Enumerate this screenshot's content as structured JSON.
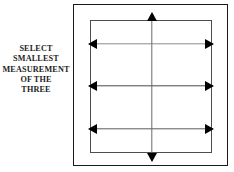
{
  "figure": {
    "background_color": "#ffffff",
    "caption": {
      "name": "instruction-text",
      "lines": [
        "SELECT",
        "SMALLEST",
        "MEASUREMENT",
        "OF THE",
        "THREE"
      ],
      "full_text": "SELECT SMALLEST MEASUREMENT OF THE THREE",
      "color": "#1d1d1d",
      "align": "center"
    },
    "outer_frame": {
      "name": "outer-frame",
      "border_color": "#1a1a1a"
    },
    "inner_box": {
      "name": "inner-measurement-box",
      "border_color": "#4d4d4d"
    },
    "arrows": [
      {
        "id": "arrow-top",
        "label": "top horizontal measurement arrow",
        "orientation": "horizontal",
        "heads": "both",
        "shaft_color": "#8c8c8c",
        "head_color": "#000000"
      },
      {
        "id": "arrow-middle",
        "label": "middle horizontal measurement arrow",
        "orientation": "horizontal",
        "heads": "both",
        "shaft_color": "#4a4a4a",
        "head_color": "#000000"
      },
      {
        "id": "arrow-bottom",
        "label": "bottom horizontal measurement arrow",
        "orientation": "horizontal",
        "heads": "both",
        "shaft_color": "#5c5c5c",
        "head_color": "#000000"
      },
      {
        "id": "arrow-vertical",
        "label": "vertical measurement arrow",
        "orientation": "vertical",
        "heads": "both",
        "shaft_color": "#6a6a6a",
        "head_color": "#000000"
      }
    ]
  }
}
